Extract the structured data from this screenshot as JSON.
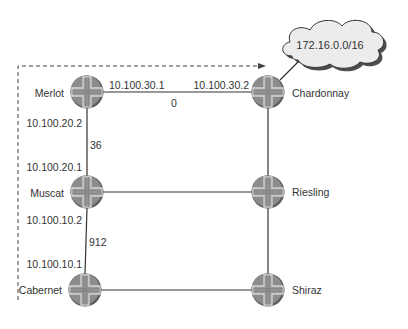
{
  "diagram": {
    "type": "network-topology",
    "cloud": {
      "label": "172.16.0.0/16"
    },
    "routers": [
      {
        "id": "merlot",
        "name": "Merlot",
        "x": 87,
        "y": 92
      },
      {
        "id": "chardonnay",
        "name": "Chardonnay",
        "x": 268,
        "y": 92
      },
      {
        "id": "muscat",
        "name": "Muscat",
        "x": 87,
        "y": 192
      },
      {
        "id": "riesling",
        "name": "Riesling",
        "x": 268,
        "y": 192
      },
      {
        "id": "cabernet",
        "name": "Cabernet",
        "x": 85,
        "y": 290
      },
      {
        "id": "shiraz",
        "name": "Shiraz",
        "x": 268,
        "y": 290
      }
    ],
    "links": [
      {
        "from": "merlot",
        "to": "chardonnay",
        "from_ip": "10.100.30.1",
        "to_ip": "10.100.30.2",
        "metric": "0"
      },
      {
        "from": "merlot",
        "to": "muscat",
        "from_ip": "10.100.20.2",
        "to_ip": "10.100.20.1",
        "metric": "36"
      },
      {
        "from": "muscat",
        "to": "cabernet",
        "from_ip": "10.100.10.2",
        "to_ip": "10.100.10.1",
        "metric": "912"
      },
      {
        "from": "muscat",
        "to": "riesling"
      },
      {
        "from": "chardonnay",
        "to": "riesling"
      },
      {
        "from": "riesling",
        "to": "shiraz"
      },
      {
        "from": "cabernet",
        "to": "shiraz"
      },
      {
        "from": "chardonnay",
        "to": "cloud"
      }
    ],
    "flow_arrow": {
      "style": "dashed",
      "description": "path from Cabernet up the left side to the 172.16.0.0/16 cloud"
    },
    "colors": {
      "router_fill": "#8a8a8a",
      "router_cross": "#c9c9c9",
      "cloud_fill": "#ececec",
      "cloud_shadow": "#5a5a5a",
      "line": "#333333"
    }
  }
}
